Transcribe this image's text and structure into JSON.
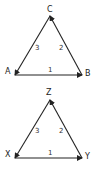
{
  "diagrams": [
    {
      "vertices": {
        "left": "A",
        "right": "B",
        "top": "C"
      },
      "edges": {
        "bottom": "1",
        "right": "2",
        "left": "3"
      }
    },
    {
      "vertices": {
        "left": "X",
        "right": "Y",
        "top": "Z"
      },
      "edges": {
        "bottom": "1",
        "right": "2",
        "left": "3"
      }
    }
  ],
  "colors": {
    "stroke": "#222222",
    "background": "#ffffff"
  }
}
